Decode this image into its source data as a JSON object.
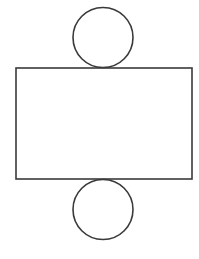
{
  "diagram": {
    "canvas": {
      "width": 199,
      "height": 259,
      "background": "#ffffff"
    },
    "stroke": {
      "color": "#3a3a3a",
      "width": 1.6
    },
    "shapes": {
      "top_circle": {
        "cx": 103,
        "cy": 37.5,
        "r": 30
      },
      "rectangle": {
        "x": 16,
        "y": 68,
        "width": 176,
        "height": 111
      },
      "bottom_circle": {
        "cx": 103,
        "cy": 209.5,
        "r": 30
      }
    }
  }
}
